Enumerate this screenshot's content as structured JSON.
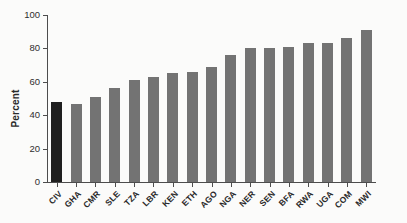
{
  "figure": {
    "background_color": "#fbfbfa",
    "axis_color": "#4d4d4d",
    "text_color": "#2a2a2a"
  },
  "chart_data": {
    "type": "bar",
    "title": "",
    "xlabel": "",
    "ylabel": "Percent",
    "ylim": [
      0,
      100
    ],
    "yticks": [
      0,
      20,
      40,
      60,
      80,
      100
    ],
    "grid": false,
    "legend_position": "none",
    "categories": [
      "CIV",
      "GHA",
      "CMR",
      "SLE",
      "TZA",
      "LBR",
      "KEN",
      "ETH",
      "AGO",
      "NGA",
      "NER",
      "SEN",
      "BFA",
      "RWA",
      "UGA",
      "COM",
      "MWI"
    ],
    "values": [
      48,
      47,
      51,
      56,
      61,
      63,
      65,
      66,
      69,
      76,
      80,
      80,
      81,
      83,
      83,
      86,
      91
    ],
    "highlighted_category": "CIV",
    "bar_color": "#737373",
    "highlight_bar_color": "#1f1f1f"
  }
}
